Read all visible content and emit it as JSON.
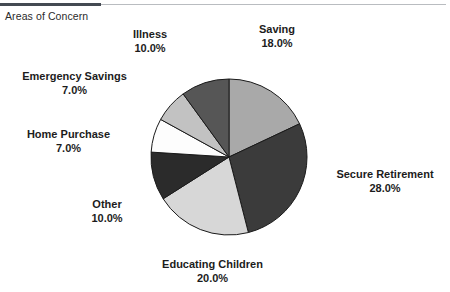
{
  "chart": {
    "title": "Areas of Concern"
  },
  "chart_data": {
    "type": "pie",
    "title": "Areas of Concern",
    "xlabel": "",
    "ylabel": "",
    "legend_position": "none",
    "grid": false,
    "start_angle_deg": 0,
    "direction": "clockwise",
    "labels_show_percent": true,
    "categories": [
      "Saving",
      "Secure Retirement",
      "Educating Children",
      "Other",
      "Home Purchase",
      "Emergency Savings",
      "Illness"
    ],
    "values": [
      18.0,
      28.0,
      20.0,
      10.0,
      7.0,
      7.0,
      10.0
    ],
    "value_labels": [
      "18.0%",
      "28.0%",
      "20.0%",
      "10.0%",
      "7.0%",
      "7.0%",
      "10.0%"
    ],
    "colors": [
      "#a9a9a9",
      "#3b3b3b",
      "#d7d7d7",
      "#2b2b2b",
      "#fdfdfd",
      "#c2c2c2",
      "#565656"
    ],
    "slices": [
      {
        "name": "Saving",
        "value": 18.0,
        "label": "Saving",
        "percent": "18.0%",
        "color": "#a9a9a9"
      },
      {
        "name": "Secure Retirement",
        "value": 28.0,
        "label": "Secure Retirement",
        "percent": "28.0%",
        "color": "#3b3b3b"
      },
      {
        "name": "Educating Children",
        "value": 20.0,
        "label": "Educating Children",
        "percent": "20.0%",
        "color": "#d7d7d7"
      },
      {
        "name": "Other",
        "value": 10.0,
        "label": "Other",
        "percent": "10.0%",
        "color": "#2b2b2b"
      },
      {
        "name": "Home Purchase",
        "value": 7.0,
        "label": "Home Purchase",
        "percent": "7.0%",
        "color": "#fdfdfd"
      },
      {
        "name": "Emergency Savings",
        "value": 7.0,
        "label": "Emergency Savings",
        "percent": "7.0%",
        "color": "#c2c2c2"
      },
      {
        "name": "Illness",
        "value": 10.0,
        "label": "Illness",
        "percent": "10.0%",
        "color": "#565656"
      }
    ],
    "total": 100.0
  },
  "style": {
    "rule_color": "#444a52",
    "rule_thin_color": "#b9bcc0",
    "slice_outline": "#1a1a1a",
    "background": "#ffffff"
  }
}
